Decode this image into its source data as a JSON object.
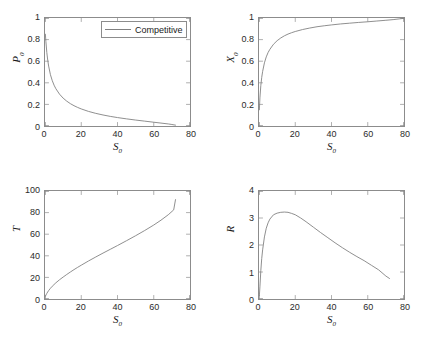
{
  "figure": {
    "background": "#ffffff",
    "line_color": "#808080",
    "axis_color": "#8c8c8c",
    "text_color": "#1a1a1a"
  },
  "legend": {
    "label": "Competitive"
  },
  "chart_data": [
    {
      "type": "line",
      "panel": "top-left",
      "title": "",
      "xlabel": "S_0",
      "ylabel": "P_0",
      "xlim": [
        0,
        80
      ],
      "ylim": [
        0,
        1
      ],
      "xticks": [
        0,
        20,
        40,
        60,
        80
      ],
      "yticks": [
        0,
        0.2,
        0.4,
        0.6,
        0.8,
        1
      ],
      "xtick_labels": [
        "0",
        "20",
        "40",
        "60",
        "80"
      ],
      "ytick_labels": [
        "0",
        "0.2",
        "0.4",
        "0.6",
        "0.8",
        "1"
      ],
      "grid": false,
      "legend": "Competitive",
      "legend_position": "top-right",
      "series": [
        {
          "name": "Competitive",
          "color": "#808080",
          "x": [
            0.2,
            0.5,
            1,
            1.5,
            2,
            3,
            4,
            5,
            6,
            8,
            10,
            12,
            14,
            16,
            18,
            20,
            24,
            28,
            32,
            36,
            40,
            45,
            50,
            55,
            60,
            64,
            68,
            70,
            72
          ],
          "y": [
            0.85,
            0.78,
            0.68,
            0.61,
            0.555,
            0.475,
            0.42,
            0.378,
            0.345,
            0.295,
            0.258,
            0.23,
            0.207,
            0.188,
            0.172,
            0.158,
            0.135,
            0.117,
            0.102,
            0.089,
            0.078,
            0.066,
            0.055,
            0.045,
            0.035,
            0.027,
            0.019,
            0.014,
            0.008
          ]
        }
      ]
    },
    {
      "type": "line",
      "panel": "top-right",
      "title": "",
      "xlabel": "S_0",
      "ylabel": "X_0",
      "xlim": [
        0,
        80
      ],
      "ylim": [
        0,
        1
      ],
      "xticks": [
        0,
        20,
        40,
        60,
        80
      ],
      "yticks": [
        0,
        0.2,
        0.4,
        0.6,
        0.8,
        1
      ],
      "xtick_labels": [
        "0",
        "20",
        "40",
        "60",
        "80"
      ],
      "ytick_labels": [
        "0",
        "0.2",
        "0.4",
        "0.6",
        "0.8",
        "1"
      ],
      "grid": false,
      "series": [
        {
          "name": "Competitive",
          "color": "#808080",
          "x": [
            0.2,
            0.5,
            1,
            1.5,
            2,
            3,
            4,
            5,
            6,
            8,
            10,
            12,
            14,
            16,
            18,
            20,
            24,
            28,
            32,
            36,
            40,
            45,
            50,
            55,
            60,
            65,
            70,
            74,
            78,
            80
          ],
          "y": [
            0.15,
            0.26,
            0.375,
            0.45,
            0.505,
            0.585,
            0.64,
            0.68,
            0.71,
            0.757,
            0.79,
            0.815,
            0.835,
            0.851,
            0.864,
            0.875,
            0.893,
            0.907,
            0.919,
            0.928,
            0.936,
            0.945,
            0.952,
            0.959,
            0.965,
            0.972,
            0.979,
            0.985,
            0.993,
            0.997
          ]
        }
      ]
    },
    {
      "type": "line",
      "panel": "bottom-left",
      "title": "",
      "xlabel": "S_0",
      "ylabel": "T",
      "xlim": [
        0,
        80
      ],
      "ylim": [
        0,
        100
      ],
      "xticks": [
        0,
        20,
        40,
        60,
        80
      ],
      "yticks": [
        0,
        20,
        40,
        60,
        80,
        100
      ],
      "xtick_labels": [
        "0",
        "20",
        "40",
        "60",
        "80"
      ],
      "ytick_labels": [
        "0",
        "20",
        "40",
        "60",
        "80",
        "100"
      ],
      "grid": false,
      "series": [
        {
          "name": "Competitive",
          "color": "#808080",
          "x": [
            0.2,
            0.5,
            1,
            2,
            3,
            4,
            6,
            8,
            10,
            12,
            14,
            16,
            18,
            20,
            24,
            28,
            32,
            36,
            40,
            45,
            50,
            55,
            60,
            64,
            68,
            71,
            72
          ],
          "y": [
            2.5,
            3.6,
            5.2,
            7.8,
            9.9,
            11.8,
            15.0,
            17.8,
            20.3,
            22.7,
            25.0,
            27.2,
            29.3,
            31.3,
            35.2,
            38.9,
            42.5,
            46.0,
            49.5,
            54.0,
            58.6,
            63.4,
            68.5,
            73.0,
            78.0,
            82.5,
            92.0
          ]
        }
      ]
    },
    {
      "type": "line",
      "panel": "bottom-right",
      "title": "",
      "xlabel": "S_0",
      "ylabel": "R",
      "xlim": [
        0,
        80
      ],
      "ylim": [
        0,
        4
      ],
      "xticks": [
        0,
        20,
        40,
        60,
        80
      ],
      "yticks": [
        0,
        1,
        2,
        3,
        4
      ],
      "xtick_labels": [
        "0",
        "20",
        "40",
        "60",
        "80"
      ],
      "ytick_labels": [
        "0",
        "1",
        "2",
        "3",
        "4"
      ],
      "grid": false,
      "series": [
        {
          "name": "Competitive",
          "color": "#808080",
          "x": [
            0.2,
            0.5,
            1,
            1.5,
            2,
            3,
            4,
            5,
            6,
            8,
            10,
            12,
            14,
            16,
            18,
            20,
            23,
            26,
            30,
            34,
            38,
            42,
            46,
            50,
            54,
            58,
            62,
            66,
            70,
            72
          ],
          "y": [
            0.12,
            0.45,
            1.05,
            1.5,
            1.82,
            2.3,
            2.62,
            2.82,
            2.96,
            3.12,
            3.18,
            3.21,
            3.22,
            3.21,
            3.17,
            3.12,
            3.0,
            2.86,
            2.66,
            2.46,
            2.27,
            2.08,
            1.9,
            1.73,
            1.57,
            1.42,
            1.25,
            1.08,
            0.85,
            0.76
          ]
        }
      ]
    }
  ],
  "panels": [
    {
      "id": "panel-p0",
      "xlabel_html": "S<sub>0</sub>",
      "ylabel_html": "P<sub>0</sub>"
    },
    {
      "id": "panel-x0",
      "xlabel_html": "S<sub>0</sub>",
      "ylabel_html": "X<sub>0</sub>"
    },
    {
      "id": "panel-t",
      "xlabel_html": "S<sub>0</sub>",
      "ylabel_html": "T"
    },
    {
      "id": "panel-r",
      "xlabel_html": "S<sub>0</sub>",
      "ylabel_html": "R"
    }
  ]
}
